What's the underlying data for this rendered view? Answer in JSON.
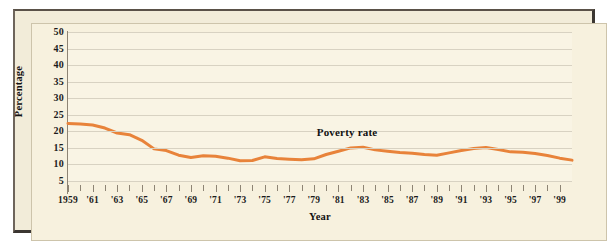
{
  "figure": {
    "background_color": "#F7F1DE",
    "frame_color": "#3b3631",
    "accent_color": "#E8833A"
  },
  "chart_data": {
    "type": "line",
    "title": "",
    "xlabel": "Year",
    "ylabel": "Percentage",
    "grid": true,
    "legend_position": "inline-annotation",
    "xlim": [
      1959,
      2000
    ],
    "ylim": [
      0,
      50
    ],
    "yticks": [
      5,
      10,
      15,
      20,
      25,
      30,
      35,
      40,
      45,
      50
    ],
    "ytick_labels": [
      "5",
      "10",
      "15",
      "20",
      "25",
      "30",
      "35",
      "40",
      "45",
      "50"
    ],
    "xticks": [
      1959,
      1961,
      1963,
      1965,
      1967,
      1969,
      1971,
      1973,
      1975,
      1977,
      1979,
      1981,
      1983,
      1985,
      1987,
      1989,
      1991,
      1993,
      1995,
      1997,
      1999
    ],
    "xtick_labels": [
      "1959",
      "'61",
      "'63",
      "'65",
      "'67",
      "'69",
      "'71",
      "'73",
      "'75",
      "'77",
      "'79",
      "'81",
      "'83",
      "'85",
      "'87",
      "'89",
      "'91",
      "'93",
      "'95",
      "'97",
      "'99"
    ],
    "annotations": [
      {
        "text": "Poverty rate",
        "x": 1982,
        "y": 19.5
      }
    ],
    "series": [
      {
        "name": "Poverty rate",
        "color": "#E8833A",
        "x": [
          1959,
          1960,
          1961,
          1962,
          1963,
          1964,
          1965,
          1966,
          1967,
          1968,
          1969,
          1970,
          1971,
          1972,
          1973,
          1974,
          1975,
          1976,
          1977,
          1978,
          1979,
          1980,
          1981,
          1982,
          1983,
          1984,
          1985,
          1986,
          1987,
          1988,
          1989,
          1990,
          1991,
          1992,
          1993,
          1994,
          1995,
          1996,
          1997,
          1998,
          1999,
          2000
        ],
        "values": [
          22.4,
          22.2,
          21.9,
          21.0,
          19.5,
          19.0,
          17.3,
          14.7,
          14.2,
          12.8,
          12.1,
          12.6,
          12.5,
          11.9,
          11.1,
          11.2,
          12.3,
          11.8,
          11.6,
          11.4,
          11.7,
          13.0,
          14.0,
          15.0,
          15.2,
          14.4,
          14.0,
          13.6,
          13.4,
          13.0,
          12.8,
          13.5,
          14.2,
          14.8,
          15.1,
          14.5,
          13.8,
          13.7,
          13.3,
          12.7,
          11.9,
          11.3
        ]
      }
    ]
  }
}
